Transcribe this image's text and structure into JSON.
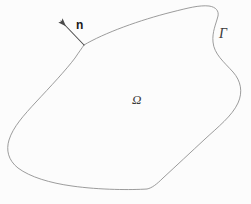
{
  "figure": {
    "kind": "math-domain-diagram",
    "canvas": {
      "width": 251,
      "height": 204
    },
    "background_color": "#fcfcfc",
    "stroke_color": "#8a8a8a",
    "arrow_color": "#4a4a4a",
    "text_color": "#3a3a3a",
    "labels": {
      "domain": "Ω",
      "boundary": "Γ",
      "normal": "n"
    },
    "geometry": {
      "boundary_path": "M 84 45 C 104 33, 140 20, 172 12 C 188 8, 199 5, 209 6 C 216 7, 219 11, 218 16 C 216 24, 212 32, 213 42 C 214 54, 224 62, 233 72 C 241 81, 243 92, 238 103 C 232 116, 218 127, 205 139 C 191 152, 176 166, 163 178 C 157 184, 152 188, 147 189 C 132 190, 100 190, 72 186 C 50 183, 30 177, 18 168 C 8 160, 6 150, 9 140 C 13 127, 24 115, 36 102 C 50 87, 66 70, 75 58 C 79 52, 82 48, 84 45 Z",
      "normal_arrow": {
        "x1": 84,
        "y1": 45,
        "x2": 61,
        "y2": 21
      },
      "gamma_leader_anchor": {
        "x": 219,
        "y": 27
      }
    }
  }
}
